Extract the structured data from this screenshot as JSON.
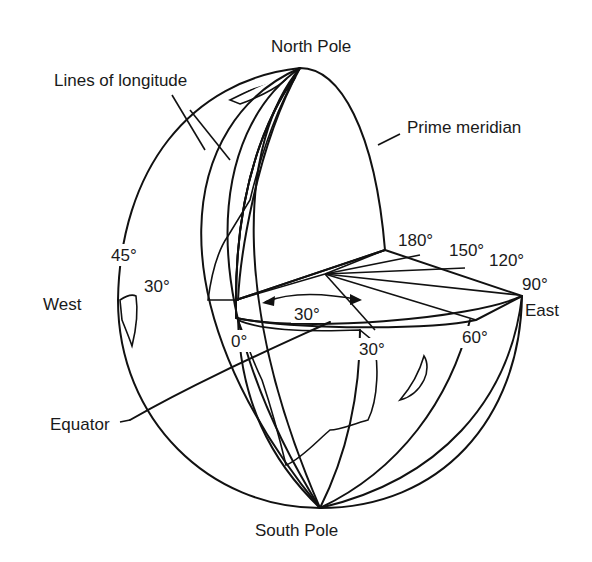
{
  "diagram": {
    "title_labels": {
      "north_pole": "North Pole",
      "south_pole": "South Pole",
      "lines_of_longitude": "Lines of longitude",
      "prime_meridian": "Prime meridian",
      "west": "West",
      "east": "East",
      "equator": "Equator"
    },
    "degree_labels": {
      "west_45": "45°",
      "west_30": "30°",
      "zero": "0°",
      "wedge_30": "30°",
      "east_30": "30°",
      "east_60": "60°",
      "east_90": "90°",
      "east_120": "120°",
      "east_150": "150°",
      "east_180": "180°"
    },
    "colors": {
      "ocean_pattern": "#8a8a8a",
      "land_pattern": "#c9c9c9",
      "cutaway": "#ffffff",
      "ink": "#111111"
    }
  }
}
